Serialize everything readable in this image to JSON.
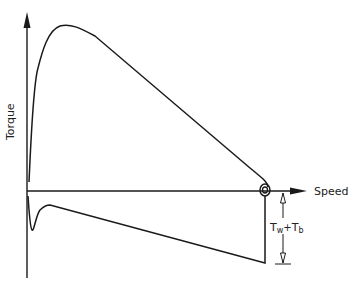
{
  "diagram": {
    "type": "torque-speed curve",
    "axes": {
      "y_label": "Torque",
      "x_label": "Speed"
    },
    "annotation": {
      "label_main": "T",
      "sub1": "w",
      "plus": "+",
      "label_second": "T",
      "sub2": "b",
      "full_text": "Tw+Tb"
    },
    "colors": {
      "line": "#1a1a1a",
      "background": "#ffffff"
    }
  }
}
